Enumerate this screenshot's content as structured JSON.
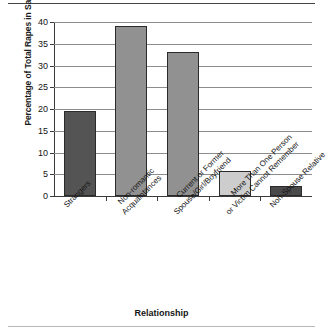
{
  "chart_data": {
    "type": "bar",
    "title": "",
    "xlabel": "Relationship",
    "ylabel": "Percentage of Total Rapes in Sample",
    "categories": [
      "Strangers",
      "Non-romantic Acquaintances",
      "Current or Former Spouse/Girl/Boyfriend",
      "More Than One Person or Victim Cannot Remember",
      "Non-Spouse Relative"
    ],
    "category_lines": [
      [
        "Strangers",
        ""
      ],
      [
        "Non-romantic",
        "Acquaintances"
      ],
      [
        "Current or Former",
        "Spouse/Girl/Boyfriend"
      ],
      [
        "More Than One Person",
        "or Victim Cannot Remember"
      ],
      [
        "Non-Spouse Relative",
        ""
      ]
    ],
    "values": [
      19.5,
      39.0,
      33.0,
      5.7,
      2.2
    ],
    "bar_colors": [
      "#545454",
      "#919191",
      "#919191",
      "#cdcdcd",
      "#4a4a4a"
    ],
    "ylim": [
      0,
      40
    ],
    "yticks": [
      0,
      5,
      10,
      15,
      20,
      25,
      30,
      35,
      40
    ],
    "ytick_labels": [
      "0",
      "5",
      "10",
      "15",
      "20",
      "25",
      "30",
      "35",
      "40"
    ],
    "grid": true,
    "legend": "none"
  }
}
